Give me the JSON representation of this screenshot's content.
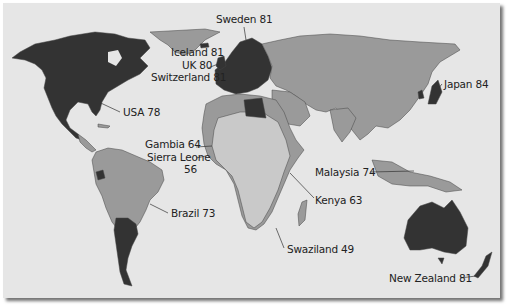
{
  "map": {
    "type": "choropleth",
    "subject": "Life expectancy by country",
    "colors": {
      "background": "#e6e6e6",
      "high": "#333333",
      "medium": "#9a9a9a",
      "low": "#c9c9c9",
      "border": "#444444"
    },
    "labels": [
      {
        "id": "sweden",
        "text": "Sweden 81",
        "country": "Sweden",
        "value": 81
      },
      {
        "id": "iceland",
        "text": "Iceland 81",
        "country": "Iceland",
        "value": 81
      },
      {
        "id": "uk",
        "text": "UK 80",
        "country": "UK",
        "value": 80
      },
      {
        "id": "switzerland",
        "text": "Switzerland 81",
        "country": "Switzerland",
        "value": 81
      },
      {
        "id": "usa",
        "text": "USA 78",
        "country": "USA",
        "value": 78
      },
      {
        "id": "japan",
        "text": "Japan 84",
        "country": "Japan",
        "value": 84
      },
      {
        "id": "gambia",
        "text": "Gambia 64",
        "country": "Gambia",
        "value": 64
      },
      {
        "id": "sierra_leone",
        "text": "Sierra Leone",
        "text2": "56",
        "country": "Sierra Leone",
        "value": 56
      },
      {
        "id": "malaysia",
        "text": "Malaysia 74",
        "country": "Malaysia",
        "value": 74
      },
      {
        "id": "kenya",
        "text": "Kenya 63",
        "country": "Kenya",
        "value": 63
      },
      {
        "id": "brazil",
        "text": "Brazil 73",
        "country": "Brazil",
        "value": 73
      },
      {
        "id": "swaziland",
        "text": "Swaziland 49",
        "country": "Swaziland",
        "value": 49
      },
      {
        "id": "new_zealand",
        "text": "New Zealand 81",
        "country": "New Zealand",
        "value": 81
      }
    ]
  }
}
